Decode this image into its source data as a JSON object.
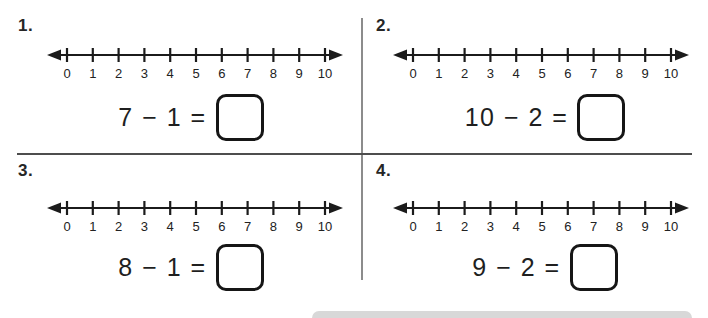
{
  "worksheet": {
    "type": "subtraction-number-line-practice"
  },
  "colors": {
    "ink": "#1b1b1b",
    "tick_label": "#222222",
    "vertical_divider": "#8c8c8c",
    "horizontal_divider": "#4d4d4d",
    "bottom_band": "#d8d8d8"
  },
  "numberline": {
    "tick_labels": [
      "0",
      "1",
      "2",
      "3",
      "4",
      "5",
      "6",
      "7",
      "8",
      "9",
      "10"
    ],
    "min": 0,
    "max": 10
  },
  "problems": [
    {
      "number": "1.",
      "expression": "7 − 1 =",
      "minuend": "7",
      "subtrahend": "1",
      "answer": ""
    },
    {
      "number": "2.",
      "expression": "10 − 2 =",
      "minuend": "10",
      "subtrahend": "2",
      "answer": ""
    },
    {
      "number": "3.",
      "expression": "8 − 1 =",
      "minuend": "8",
      "subtrahend": "1",
      "answer": ""
    },
    {
      "number": "4.",
      "expression": "9 − 2 =",
      "minuend": "9",
      "subtrahend": "2",
      "answer": ""
    }
  ]
}
